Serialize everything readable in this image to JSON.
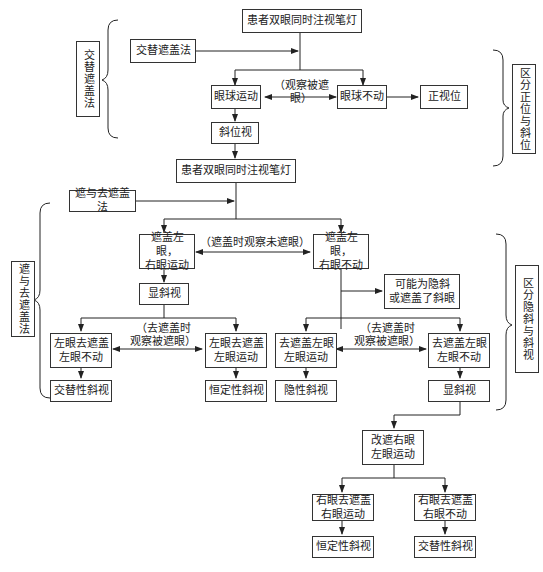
{
  "section1": {
    "side_label": "交替遮盖法",
    "right_label": "区分正位与斜位",
    "start": "患者双眼同时注视笔灯",
    "method": "交替遮盖法",
    "moves": "眼球运动",
    "no_move": "眼球不动",
    "observe": "（观察被遮眼）",
    "orthophoria": "正视位",
    "heterotropia": "斜位视"
  },
  "section2": {
    "side_label": "遮与去遮盖法",
    "right_label": "区分隐斜与斜视",
    "start": "患者双眼同时注视笔灯",
    "method": "遮与去遮盖法",
    "cover_left_right_moves": "遮盖左眼，\n右眼运动",
    "cover_left_right_still": "遮盖左眼，\n右眼不动",
    "observe_uncovered": "（遮盖时观察未遮眼）",
    "manifest": "显斜视",
    "possible": "可能为隐斜\n或遮盖了斜眼",
    "observe_covered_left": "（去遮盖时\n观察被遮眼）",
    "observe_covered_right": "（去遮盖时\n观察被遮眼）",
    "l_uncover_still": "左眼去遮盖\n左眼不动",
    "l_uncover_moves": "左眼去遮盖\n左眼运动",
    "uncover_l_moves": "去遮盖左眼\n左眼运动",
    "uncover_l_still": "去遮盖左眼\n左眼不动",
    "alternating": "交替性斜视",
    "constant": "恒定性斜视",
    "latent": "隐性斜视",
    "manifest2": "显斜视",
    "switch_cover": "改遮右眼\n左眼运动",
    "r_uncover_moves": "右眼去遮盖\n右眼运动",
    "r_uncover_still": "右眼去遮盖\n右眼不动",
    "constant2": "恒定性斜视",
    "alternating2": "交替性斜视"
  }
}
